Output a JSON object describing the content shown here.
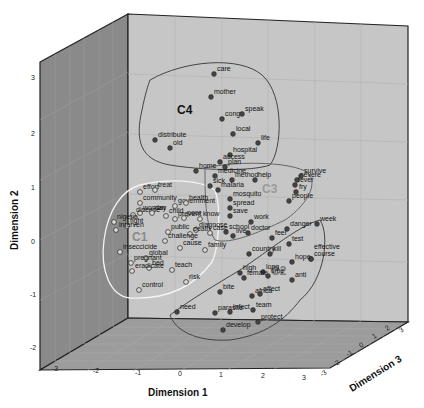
{
  "chart_data": {
    "type": "scatter",
    "subtype": "3d-scatter",
    "title": "",
    "xlabel": "Dimension 1",
    "ylabel": "Dimension 2",
    "zlabel": "Dimension 3",
    "xlim": [
      -3,
      3
    ],
    "ylim": [
      -2,
      3
    ],
    "zlim": [
      -3,
      3
    ],
    "x_ticks": [
      "-3",
      "-2",
      "-1",
      "0",
      "1",
      "2",
      "3"
    ],
    "y_ticks": [
      "3",
      "2",
      "1",
      "0",
      "-1",
      "-2"
    ],
    "z_ticks": [
      "-3",
      "-2",
      "-1",
      "0",
      "1",
      "2",
      "3"
    ],
    "grid": true,
    "legend": null,
    "clusters": [
      {
        "name": "C1",
        "marker": "hollow-circle",
        "outline": "#ffffff",
        "words": [
          "effort",
          "treat",
          "woman",
          "community",
          "government",
          "disease",
          "day",
          "child",
          "health",
          "nigeria",
          "fight",
          "prevent",
          "poor",
          "know",
          "interven",
          "diagnose",
          "public",
          "death",
          "case",
          "inseccicide",
          "challenge",
          "global",
          "cause",
          "family",
          "pregnant",
          "bed",
          "eradicate",
          "teach",
          "control",
          "risk"
        ]
      },
      {
        "name": "C2",
        "marker": "filled-circle",
        "outline": "#444444",
        "words": [
          "week",
          "danger",
          "doctor",
          "feel",
          "test",
          "country",
          "kill",
          "course",
          "effective",
          "hope",
          "high",
          "long",
          "anti",
          "bite",
          "female",
          "time",
          "africa",
          "affect",
          "need",
          "infect",
          "team",
          "parasite",
          "protect",
          "develop"
        ]
      },
      {
        "name": "C3",
        "marker": "filled-circle",
        "outline": "#666666",
        "words": [
          "home",
          "plan",
          "medicine",
          "method",
          "help",
          "severe",
          "survive",
          "sick",
          "malaria",
          "fry",
          "fever",
          "mosquito",
          "spread",
          "people",
          "save",
          "work",
          "school",
          "live"
        ]
      },
      {
        "name": "C4",
        "marker": "filled-circle",
        "outline": "#444444",
        "words": [
          "care",
          "mother",
          "congo",
          "speak",
          "local",
          "distribute",
          "old",
          "life",
          "hospital",
          "access"
        ]
      }
    ],
    "points": [
      {
        "word": "care",
        "cluster": "C4",
        "px": 214,
        "py": 74
      },
      {
        "word": "mother",
        "cluster": "C4",
        "px": 211,
        "py": 97
      },
      {
        "word": "congo",
        "cluster": "C4",
        "px": 222,
        "py": 119
      },
      {
        "word": "speak",
        "cluster": "C4",
        "px": 242,
        "py": 114
      },
      {
        "word": "local",
        "cluster": "C4",
        "px": 233,
        "py": 134
      },
      {
        "word": "distribute",
        "cluster": "C4",
        "px": 155,
        "py": 140
      },
      {
        "word": "life",
        "cluster": "C4",
        "px": 258,
        "py": 143
      },
      {
        "word": "old",
        "cluster": "C4",
        "px": 170,
        "py": 148
      },
      {
        "word": "hospital",
        "cluster": "C4",
        "px": 230,
        "py": 155
      },
      {
        "word": "access",
        "cluster": "C4",
        "px": 220,
        "py": 162
      },
      {
        "word": "home",
        "cluster": "C3",
        "px": 196,
        "py": 171
      },
      {
        "word": "plan",
        "cluster": "C3",
        "px": 225,
        "py": 167
      },
      {
        "word": "medicine",
        "cluster": "C3",
        "px": 215,
        "py": 176
      },
      {
        "word": "method",
        "cluster": "C3",
        "px": 232,
        "py": 180
      },
      {
        "word": "help",
        "cluster": "C3",
        "px": 255,
        "py": 180
      },
      {
        "word": "severe",
        "cluster": "C3",
        "px": 297,
        "py": 180
      },
      {
        "word": "survive",
        "cluster": "C3",
        "px": 301,
        "py": 176
      },
      {
        "word": "sick",
        "cluster": "C3",
        "px": 210,
        "py": 186
      },
      {
        "word": "malaria",
        "cluster": "C3",
        "px": 218,
        "py": 190
      },
      {
        "word": "fry",
        "cluster": "C3",
        "px": 296,
        "py": 192
      },
      {
        "word": "fever",
        "cluster": "C3",
        "px": 295,
        "py": 185
      },
      {
        "word": "mosquito",
        "cluster": "C3",
        "px": 230,
        "py": 199
      },
      {
        "word": "spread",
        "cluster": "C3",
        "px": 230,
        "py": 208
      },
      {
        "word": "people",
        "cluster": "C3",
        "px": 289,
        "py": 201
      },
      {
        "word": "save",
        "cluster": "C3",
        "px": 230,
        "py": 216
      },
      {
        "word": "work",
        "cluster": "C3",
        "px": 251,
        "py": 222
      },
      {
        "word": "school",
        "cluster": "C3",
        "px": 226,
        "py": 232
      },
      {
        "word": "live",
        "cluster": "C3",
        "px": 233,
        "py": 236
      },
      {
        "word": "effort",
        "cluster": "C1",
        "px": 140,
        "py": 192
      },
      {
        "word": "treat",
        "cluster": "C1",
        "px": 155,
        "py": 190
      },
      {
        "word": "woman",
        "cluster": "C1",
        "px": 140,
        "py": 213
      },
      {
        "word": "community",
        "cluster": "C1",
        "px": 140,
        "py": 203
      },
      {
        "word": "government",
        "cluster": "C1",
        "px": 175,
        "py": 206
      },
      {
        "word": "disease",
        "cluster": "C1",
        "px": 133,
        "py": 215
      },
      {
        "word": "day",
        "cluster": "C1",
        "px": 152,
        "py": 213
      },
      {
        "word": "child",
        "cluster": "C1",
        "px": 166,
        "py": 216
      },
      {
        "word": "health",
        "cluster": "C1",
        "px": 186,
        "py": 203
      },
      {
        "word": "nigeria",
        "cluster": "C1",
        "px": 114,
        "py": 222
      },
      {
        "word": "fight",
        "cluster": "C1",
        "px": 127,
        "py": 226
      },
      {
        "word": "prevent",
        "cluster": "C1",
        "px": 175,
        "py": 219
      },
      {
        "word": "poor",
        "cluster": "C1",
        "px": 184,
        "py": 218
      },
      {
        "word": "know",
        "cluster": "C1",
        "px": 200,
        "py": 219
      },
      {
        "word": "interven",
        "cluster": "C1",
        "px": 116,
        "py": 230
      },
      {
        "word": "diagnose",
        "cluster": "C1",
        "px": 196,
        "py": 230
      },
      {
        "word": "public",
        "cluster": "C1",
        "px": 168,
        "py": 232
      },
      {
        "word": "death",
        "cluster": "C1",
        "px": 190,
        "py": 234
      },
      {
        "word": "case",
        "cluster": "C1",
        "px": 210,
        "py": 233
      },
      {
        "word": "inseccicide",
        "cluster": "C1",
        "px": 120,
        "py": 252
      },
      {
        "word": "challenge",
        "cluster": "C1",
        "px": 165,
        "py": 241
      },
      {
        "word": "global",
        "cluster": "C1",
        "px": 146,
        "py": 258
      },
      {
        "word": "cause",
        "cluster": "C1",
        "px": 180,
        "py": 248
      },
      {
        "word": "family",
        "cluster": "C1",
        "px": 205,
        "py": 250
      },
      {
        "word": "pregnant",
        "cluster": "C1",
        "px": 131,
        "py": 263
      },
      {
        "word": "bed",
        "cluster": "C1",
        "px": 149,
        "py": 268
      },
      {
        "word": "eradicate",
        "cluster": "C1",
        "px": 132,
        "py": 271
      },
      {
        "word": "teach",
        "cluster": "C1",
        "px": 172,
        "py": 270
      },
      {
        "word": "control",
        "cluster": "C1",
        "px": 139,
        "py": 290
      },
      {
        "word": "risk",
        "cluster": "C1",
        "px": 186,
        "py": 282
      },
      {
        "word": "week",
        "cluster": "C2",
        "px": 317,
        "py": 224
      },
      {
        "word": "danger",
        "cluster": "C2",
        "px": 287,
        "py": 229
      },
      {
        "word": "doctor",
        "cluster": "C2",
        "px": 248,
        "py": 233
      },
      {
        "word": "feel",
        "cluster": "C2",
        "px": 272,
        "py": 238
      },
      {
        "word": "test",
        "cluster": "C2",
        "px": 289,
        "py": 244
      },
      {
        "word": "country",
        "cluster": "C2",
        "px": 249,
        "py": 254
      },
      {
        "word": "kill",
        "cluster": "C2",
        "px": 270,
        "py": 254
      },
      {
        "word": "course",
        "cluster": "C2",
        "px": 311,
        "py": 259
      },
      {
        "word": "effective",
        "cluster": "C2",
        "px": 311,
        "py": 259
      },
      {
        "word": "hope",
        "cluster": "C2",
        "px": 292,
        "py": 262
      },
      {
        "word": "high",
        "cluster": "C2",
        "px": 240,
        "py": 273
      },
      {
        "word": "long",
        "cluster": "C2",
        "px": 263,
        "py": 272
      },
      {
        "word": "anti",
        "cluster": "C2",
        "px": 292,
        "py": 280
      },
      {
        "word": "bite",
        "cluster": "C2",
        "px": 220,
        "py": 292
      },
      {
        "word": "female",
        "cluster": "C2",
        "px": 244,
        "py": 278
      },
      {
        "word": "time",
        "cluster": "C2",
        "px": 268,
        "py": 276
      },
      {
        "word": "africa",
        "cluster": "C2",
        "px": 252,
        "py": 296
      },
      {
        "word": "affect",
        "cluster": "C2",
        "px": 260,
        "py": 294
      },
      {
        "word": "need",
        "cluster": "C2",
        "px": 177,
        "py": 312
      },
      {
        "word": "infect",
        "cluster": "C2",
        "px": 230,
        "py": 312
      },
      {
        "word": "team",
        "cluster": "C2",
        "px": 253,
        "py": 310
      },
      {
        "word": "parasite",
        "cluster": "C2",
        "px": 215,
        "py": 313
      },
      {
        "word": "protect",
        "cluster": "C2",
        "px": 258,
        "py": 322
      },
      {
        "word": "develop",
        "cluster": "C2",
        "px": 223,
        "py": 330
      }
    ]
  },
  "labels": {
    "x_axis_title": "Dimension 1",
    "y_axis_title": "Dimension 2",
    "z_axis_title": "Dimension 3",
    "c1": "C1",
    "c2": "C2",
    "c3": "C3",
    "c4": "C4"
  }
}
